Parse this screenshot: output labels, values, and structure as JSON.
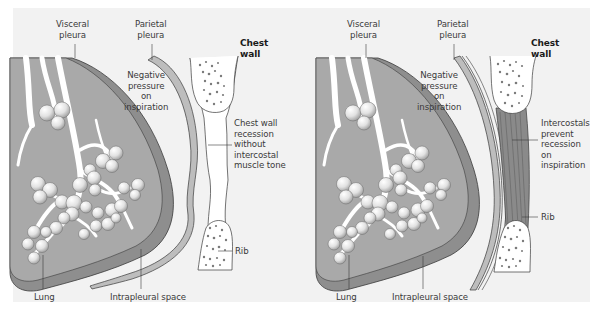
{
  "figure": {
    "background": "#f2f2f2",
    "colors": {
      "lung_tissue": "#a9a9a9",
      "visceral_pleura": "#8e8e8e",
      "parietal_pleura": "#bdbdbd",
      "airway": "#ffffff",
      "alveolus": "#e4e4e4",
      "rib_fill": "#ffffff",
      "rib_dots": "#7a7a7a",
      "intercostal_muscle": "#8a8a8a",
      "outline": "#3a3a3a"
    }
  },
  "panels": [
    {
      "id": "without-intercostal-tone",
      "labels": {
        "visceral_pleura": [
          "Visceral",
          "pleura"
        ],
        "parietal_pleura": [
          "Parietal",
          "pleura"
        ],
        "chest_wall": [
          "Chest",
          "wall"
        ],
        "negative_pressure": [
          "Negative",
          "pressure",
          "on",
          "inspiration"
        ],
        "wall_annotation": [
          "Chest wall",
          "recession",
          "without",
          "intercostal",
          "muscle tone"
        ],
        "rib": "Rib",
        "lung": "Lung",
        "intrapleural_space": "Intrapleural space"
      }
    },
    {
      "id": "with-intercostal-tone",
      "labels": {
        "visceral_pleura": [
          "Visceral",
          "pleura"
        ],
        "parietal_pleura": [
          "Parietal",
          "pleura"
        ],
        "chest_wall": [
          "Chest",
          "wall"
        ],
        "negative_pressure": [
          "Negative",
          "pressure",
          "on",
          "inspiration"
        ],
        "wall_annotation": [
          "Intercostals",
          "prevent",
          "recession",
          "on",
          "inspiration"
        ],
        "rib": "Rib",
        "lung": "Lung",
        "intrapleural_space": "Intrapleural space"
      }
    }
  ]
}
